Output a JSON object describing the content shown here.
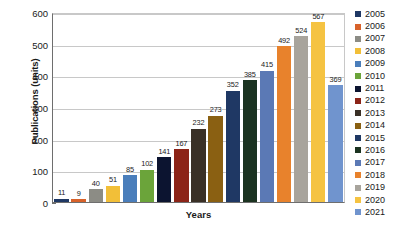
{
  "chart_data": {
    "type": "bar",
    "title": "",
    "xlabel": "Years",
    "ylabel": "Publications (units)",
    "categories": [
      "2005",
      "2006",
      "2007",
      "2008",
      "2009",
      "2010",
      "2011",
      "2012",
      "2013",
      "2014",
      "2015",
      "2016",
      "2017",
      "2018",
      "2019",
      "2020",
      "2021"
    ],
    "values": [
      11,
      9,
      40,
      51,
      85,
      102,
      141,
      167,
      232,
      273,
      352,
      385,
      415,
      492,
      524,
      567,
      369
    ],
    "colors": [
      "#1f3864",
      "#d8622a",
      "#8c8c85",
      "#f2bf38",
      "#4a7ebb",
      "#6ba43a",
      "#0c1430",
      "#8c2418",
      "#3a3026",
      "#8a6012",
      "#1f3864",
      "#1b3320",
      "#5b79b5",
      "#e8822c",
      "#a8a49c",
      "#f5c342",
      "#7094ce"
    ],
    "ylim": [
      0,
      600
    ],
    "yticks": [
      0,
      100,
      200,
      300,
      400,
      500,
      600
    ],
    "ytick_labels": [
      "0",
      "100",
      "200",
      "300",
      "400",
      "500",
      "600"
    ],
    "grid": "horizontal",
    "show_data_labels": true,
    "legend_position": "right",
    "legend_entries": [
      {
        "label": "2005",
        "color": "#1f3864"
      },
      {
        "label": "2006",
        "color": "#d8622a"
      },
      {
        "label": "2007",
        "color": "#8c8c85"
      },
      {
        "label": "2008",
        "color": "#f2bf38"
      },
      {
        "label": "2009",
        "color": "#4a7ebb"
      },
      {
        "label": "2010",
        "color": "#6ba43a"
      },
      {
        "label": "2011",
        "color": "#0c1430"
      },
      {
        "label": "2012",
        "color": "#8c2418"
      },
      {
        "label": "2013",
        "color": "#3a3026"
      },
      {
        "label": "2014",
        "color": "#8a6012"
      },
      {
        "label": "2015",
        "color": "#1f3864"
      },
      {
        "label": "2016",
        "color": "#1b3320"
      },
      {
        "label": "2017",
        "color": "#5b79b5"
      },
      {
        "label": "2018",
        "color": "#e8822c"
      },
      {
        "label": "2019",
        "color": "#a8a49c"
      },
      {
        "label": "2020",
        "color": "#f5c342"
      },
      {
        "label": "2021",
        "color": "#7094ce"
      }
    ]
  }
}
